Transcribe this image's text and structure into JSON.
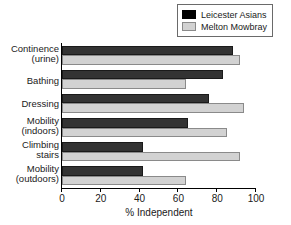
{
  "chart_data": {
    "type": "bar",
    "orientation": "horizontal",
    "title": "",
    "xlabel": "% Independent",
    "ylabel": "",
    "xlim": [
      0,
      100
    ],
    "xticks": [
      0,
      20,
      40,
      60,
      80,
      100
    ],
    "grid": false,
    "legend_position": "top-right",
    "categories": [
      "Continence\n(urine)",
      "Bathing",
      "Dressing",
      "Mobility\n(indoors)",
      "Climbing\nstairs",
      "Mobility\n(outdoors)"
    ],
    "series": [
      {
        "name": "Leicester Asians",
        "color": "#000000",
        "values": [
          88,
          83,
          76,
          65,
          42,
          42
        ]
      },
      {
        "name": "Melton Mowbray",
        "color": "#d2d2d2",
        "values": [
          92,
          64,
          94,
          85,
          92,
          64
        ]
      }
    ]
  },
  "legend": {
    "items": [
      {
        "label": "Leicester Asians"
      },
      {
        "label": "Melton Mowbray"
      }
    ]
  },
  "axis": {
    "x_title": "% Independent",
    "ticks": [
      "0",
      "20",
      "40",
      "60",
      "80",
      "100"
    ]
  },
  "categories": [
    {
      "line1": "Continence",
      "line2": "(urine)"
    },
    {
      "line1": "Bathing",
      "line2": ""
    },
    {
      "line1": "Dressing",
      "line2": ""
    },
    {
      "line1": "Mobility",
      "line2": "(indoors)"
    },
    {
      "line1": "Climbing",
      "line2": "stairs"
    },
    {
      "line1": "Mobility",
      "line2": "(outdoors)"
    }
  ]
}
